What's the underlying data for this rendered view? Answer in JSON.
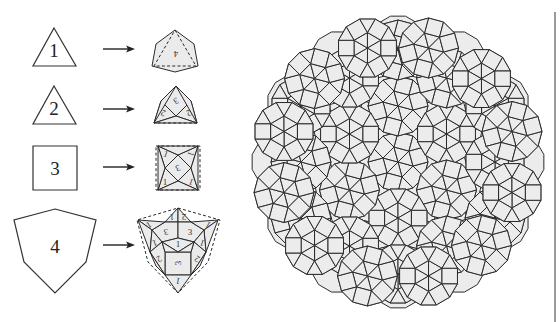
{
  "figure": {
    "background": "#ffffff",
    "tile_fill": "#ececec",
    "line_color": "#2b2b2b"
  },
  "substitution_rules": [
    {
      "prototile_label": "1",
      "prototile_shape": "equilateral-triangle",
      "prototile_points": [
        [
          54,
          28
        ],
        [
          76,
          66
        ],
        [
          33,
          66
        ]
      ],
      "label_pos": [
        54,
        50
      ],
      "arrow": {
        "x1": 103,
        "x2": 135,
        "y": 49
      },
      "result": {
        "outline_dashed": [
          [
            175,
            30
          ],
          [
            196,
            66
          ],
          [
            154,
            66
          ]
        ],
        "tiles": [
          {
            "points": [
              [
                175,
                30
              ],
              [
                194,
                44
              ],
              [
                198,
                66
              ],
              [
                175,
                72
              ],
              [
                152,
                66
              ],
              [
                156,
                44
              ]
            ],
            "label": "4",
            "label_pos": [
              176,
              54
            ],
            "rotate": 180
          }
        ]
      }
    },
    {
      "prototile_label": "2",
      "prototile_shape": "equilateral-triangle",
      "prototile_points": [
        [
          54,
          86
        ],
        [
          76,
          124
        ],
        [
          33,
          124
        ]
      ],
      "label_pos": [
        54,
        108
      ],
      "arrow": {
        "x1": 103,
        "x2": 135,
        "y": 109
      },
      "result": {
        "outline_dashed": [
          [
            197,
            123
          ],
          [
            154,
            123
          ]
        ],
        "tiles": [
          {
            "points": [
              [
                176,
                86
              ],
              [
                191,
                101
              ],
              [
                176,
                116
              ],
              [
                161,
                101
              ]
            ],
            "label": "3",
            "label_pos": [
              176,
              101
            ],
            "rotate": 150
          },
          {
            "points": [
              [
                161,
                101
              ],
              [
                176,
                116
              ],
              [
                154,
                123
              ]
            ],
            "label": "2",
            "label_pos": [
              163,
              113
            ],
            "rotate": 200
          },
          {
            "points": [
              [
                191,
                101
              ],
              [
                197,
                123
              ],
              [
                176,
                116
              ]
            ],
            "label": "2",
            "label_pos": [
              189,
              113
            ],
            "rotate": 160
          },
          {
            "points": [
              [
                154,
                123
              ],
              [
                176,
                116
              ],
              [
                197,
                123
              ]
            ],
            "label": "",
            "label_pos": [
              176,
              120
            ],
            "rotate": 0
          },
          {
            "points": [
              [
                176,
                86
              ],
              [
                161,
                101
              ],
              [
                154,
                123
              ]
            ],
            "label": "",
            "label_pos": [
              0,
              0
            ],
            "rotate": 0
          },
          {
            "points": [
              [
                176,
                86
              ],
              [
                197,
                123
              ],
              [
                191,
                101
              ]
            ],
            "label": "",
            "label_pos": [
              0,
              0
            ],
            "rotate": 0
          }
        ]
      }
    },
    {
      "prototile_label": "3",
      "prototile_shape": "square",
      "prototile_points": [
        [
          33,
          146
        ],
        [
          77,
          146
        ],
        [
          77,
          190
        ],
        [
          33,
          190
        ]
      ],
      "label_pos": [
        55,
        168
      ],
      "arrow": {
        "x1": 103,
        "x2": 135,
        "y": 167
      },
      "result": {
        "outline_dashed": [
          [
            156,
            146
          ],
          [
            200,
            146
          ],
          [
            200,
            190
          ],
          [
            156,
            190
          ]
        ],
        "tiles": [
          {
            "points": [
              [
                178,
                155
              ],
              [
                191,
                168
              ],
              [
                178,
                181
              ],
              [
                165,
                168
              ]
            ],
            "label": "3",
            "label_pos": [
              178,
              168
            ],
            "rotate": 160
          },
          {
            "points": [
              [
                158,
                146
              ],
              [
                178,
                155
              ],
              [
                165,
                168
              ]
            ],
            "label": "1",
            "label_pos": [
              166,
              154
            ],
            "rotate": 20
          },
          {
            "points": [
              [
                198,
                146
              ],
              [
                191,
                168
              ],
              [
                178,
                155
              ]
            ],
            "label": "1",
            "label_pos": [
              191,
              154
            ],
            "rotate": 110
          },
          {
            "points": [
              [
                158,
                190
              ],
              [
                165,
                168
              ],
              [
                178,
                181
              ]
            ],
            "label": "1",
            "label_pos": [
              165,
              182
            ],
            "rotate": 0
          },
          {
            "points": [
              [
                198,
                190
              ],
              [
                178,
                181
              ],
              [
                191,
                168
              ]
            ],
            "label": "1",
            "label_pos": [
              191,
              182
            ],
            "rotate": 200
          },
          {
            "points": [
              [
                158,
                146
              ],
              [
                165,
                168
              ],
              [
                158,
                190
              ]
            ],
            "label": "",
            "label_pos": [
              0,
              0
            ],
            "rotate": 0
          },
          {
            "points": [
              [
                198,
                146
              ],
              [
                198,
                190
              ],
              [
                191,
                168
              ]
            ],
            "label": "",
            "label_pos": [
              0,
              0
            ],
            "rotate": 0
          },
          {
            "points": [
              [
                158,
                146
              ],
              [
                198,
                146
              ],
              [
                178,
                155
              ]
            ],
            "label": "",
            "label_pos": [
              0,
              0
            ],
            "rotate": 0
          },
          {
            "points": [
              [
                158,
                190
              ],
              [
                178,
                181
              ],
              [
                198,
                190
              ]
            ],
            "label": "",
            "label_pos": [
              0,
              0
            ],
            "rotate": 0
          }
        ]
      }
    },
    {
      "prototile_label": "4",
      "prototile_shape": "irregular-hexagon",
      "prototile_points": [
        [
          55,
          209
        ],
        [
          96,
          220
        ],
        [
          86,
          262
        ],
        [
          55,
          293
        ],
        [
          24,
          262
        ],
        [
          14,
          220
        ]
      ],
      "label_pos": [
        55,
        246
      ],
      "arrow": {
        "x1": 103,
        "x2": 135,
        "y": 245
      },
      "result": {
        "outline_dashed": [
          [
            178,
            208
          ],
          [
            220,
            220
          ],
          [
            208,
            262
          ],
          [
            178,
            293
          ],
          [
            148,
            262
          ],
          [
            137,
            220
          ]
        ],
        "tiles": [
          {
            "points": [
              [
                178,
                208
              ],
              [
                178,
                222
              ],
              [
                165,
                222
              ]
            ],
            "label": "1",
            "label_pos": [
              172,
              217
            ],
            "rotate": 180
          },
          {
            "points": [
              [
                178,
                208
              ],
              [
                191,
                222
              ],
              [
                178,
                222
              ]
            ],
            "label": "2",
            "label_pos": [
              184,
              217
            ],
            "rotate": 180
          },
          {
            "points": [
              [
                165,
                222
              ],
              [
                178,
                222
              ],
              [
                178,
                238
              ],
              [
                162,
                242
              ],
              [
                152,
                230
              ]
            ],
            "label": "3",
            "label_pos": [
              166,
              232
            ],
            "rotate": 170
          },
          {
            "points": [
              [
                178,
                222
              ],
              [
                191,
                222
              ],
              [
                204,
                230
              ],
              [
                194,
                242
              ],
              [
                178,
                238
              ]
            ],
            "label": "3",
            "label_pos": [
              190,
              232
            ],
            "rotate": 0
          },
          {
            "points": [
              [
                178,
                238
              ],
              [
                194,
                242
              ],
              [
                178,
                252
              ],
              [
                162,
                242
              ]
            ],
            "label": "1",
            "label_pos": [
              178,
              244
            ],
            "rotate": 0
          },
          {
            "points": [
              [
                165,
                252
              ],
              [
                191,
                252
              ],
              [
                191,
                275
              ],
              [
                165,
                275
              ]
            ],
            "label": "3",
            "label_pos": [
              178,
              263
            ],
            "rotate": 270
          },
          {
            "points": [
              [
                138,
                220
              ],
              [
                165,
                222
              ],
              [
                152,
                230
              ]
            ],
            "label": "1",
            "label_pos": [
              149,
              225
            ],
            "rotate": 150
          },
          {
            "points": [
              [
                218,
                220
              ],
              [
                204,
                230
              ],
              [
                191,
                222
              ]
            ],
            "label": "1",
            "label_pos": [
              208,
              225
            ],
            "rotate": 210
          },
          {
            "points": [
              [
                138,
                220
              ],
              [
                152,
                230
              ],
              [
                150,
                252
              ]
            ],
            "label": "",
            "label_pos": [
              0,
              0
            ],
            "rotate": 0
          },
          {
            "points": [
              [
                218,
                220
              ],
              [
                206,
                252
              ],
              [
                204,
                230
              ]
            ],
            "label": "",
            "label_pos": [
              0,
              0
            ],
            "rotate": 0
          },
          {
            "points": [
              [
                152,
                230
              ],
              [
                162,
                242
              ],
              [
                150,
                252
              ]
            ],
            "label": "1",
            "label_pos": [
              155,
              243
            ],
            "rotate": 160
          },
          {
            "points": [
              [
                204,
                230
              ],
              [
                206,
                252
              ],
              [
                194,
                242
              ]
            ],
            "label": "1",
            "label_pos": [
              202,
              243
            ],
            "rotate": 200
          },
          {
            "points": [
              [
                150,
                252
              ],
              [
                162,
                242
              ],
              [
                165,
                252
              ],
              [
                165,
                275
              ]
            ],
            "label": "2",
            "label_pos": [
              159,
              259
            ],
            "rotate": 150
          },
          {
            "points": [
              [
                206,
                252
              ],
              [
                191,
                275
              ],
              [
                191,
                252
              ],
              [
                194,
                242
              ]
            ],
            "label": "2",
            "label_pos": [
              197,
              259
            ],
            "rotate": 210
          },
          {
            "points": [
              [
                162,
                242
              ],
              [
                178,
                252
              ],
              [
                165,
                252
              ]
            ],
            "label": "",
            "label_pos": [
              0,
              0
            ],
            "rotate": 0
          },
          {
            "points": [
              [
                194,
                242
              ],
              [
                191,
                252
              ],
              [
                178,
                252
              ]
            ],
            "label": "",
            "label_pos": [
              0,
              0
            ],
            "rotate": 0
          },
          {
            "points": [
              [
                165,
                275
              ],
              [
                191,
                275
              ],
              [
                178,
                293
              ]
            ],
            "label": "1",
            "label_pos": [
              178,
              281
            ],
            "rotate": 190
          },
          {
            "points": [
              [
                150,
                252
              ],
              [
                165,
                275
              ],
              [
                156,
                266
              ]
            ],
            "label": "",
            "label_pos": [
              0,
              0
            ],
            "rotate": 0
          },
          {
            "points": [
              [
                206,
                252
              ],
              [
                200,
                266
              ],
              [
                191,
                275
              ]
            ],
            "label": "",
            "label_pos": [
              0,
              0
            ],
            "rotate": 0
          }
        ]
      }
    }
  ],
  "tiling": {
    "center": [
      398,
      162
    ],
    "outer_radius": 146,
    "lobe_count": 12,
    "lobe_radius": 28,
    "rings": [
      {
        "radius": 0,
        "count": 1,
        "rot": 0
      },
      {
        "radius": 56,
        "count": 6,
        "rot": 0
      },
      {
        "radius": 97,
        "count": 6,
        "rot": 30
      },
      {
        "radius": 112,
        "count": 6,
        "rot": 0
      },
      {
        "radius": 118,
        "count": 12,
        "rot": 15
      }
    ]
  },
  "frame": {
    "right_rule_x": 555,
    "right_rule_y1": 12,
    "right_rule_y2": 322
  }
}
